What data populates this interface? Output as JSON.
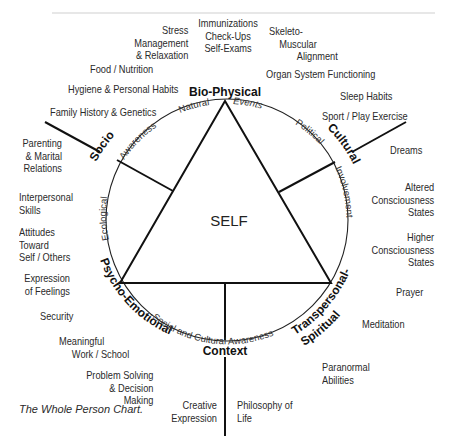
{
  "diagram": {
    "center_label": "SELF",
    "caption": "The Whole Person Chart.",
    "dimensions": {
      "top": "Bio-Physical",
      "upper_left": "Socio",
      "upper_right": "Cultural",
      "lower_left": "Psycho-Emotional",
      "lower_right_line1": "Transpersonal-",
      "lower_right_line2": "Spiritual",
      "bottom": "Context"
    },
    "arc_labels": {
      "natural": "Natural",
      "events": "Events",
      "ecological": "Ecological",
      "awareness": "Awareness",
      "political": "Political",
      "involvement": "Involvement",
      "social_cultural_awareness": "Social and Cultural Awareness"
    },
    "outer_labels": {
      "stress": "Stress\nManagement\n& Relaxation",
      "immunizations": "Immunizations\nCheck-Ups\nSelf-Exams",
      "skeleto": "Skeleto-\n    Muscular\n           Alignment",
      "food": "Food / Nutrition",
      "organ": "Organ System Functioning",
      "hygiene": "Hygiene & Personal Habits",
      "sleep": "Sleep Habits",
      "family": "Family History & Genetics",
      "sport": "Sport / Play Exercise",
      "parenting": "Parenting\n& Marital\nRelations",
      "dreams": "Dreams",
      "interpersonal": "Interpersonal\nSkills",
      "altered": "Altered\nConsciousness\nStates",
      "attitudes": "Attitudes\nToward\nSelf / Others",
      "higher": "Higher\nConsciousness\nStates",
      "expression": "Expression\nof Feelings",
      "prayer": "Prayer",
      "security": "Security",
      "meditation": "Meditation",
      "meaningful": "Meaningful\n     Work / School",
      "paranormal": "Paranormal\nAbilities",
      "problem": "Problem Solving\n& Decision\nMaking",
      "creative": "Creative\nExpression",
      "philosophy": "Philosophy of\nLife"
    }
  }
}
